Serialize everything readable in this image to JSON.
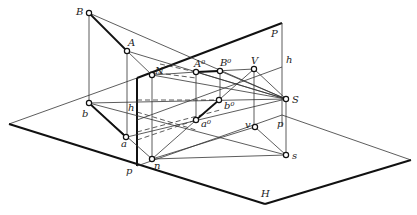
{
  "figure": {
    "type": "descriptive geometry - perspective projection of line AB onto picture plane P with ground plane H",
    "planes": {
      "picture_plane": "P",
      "ground_plane": "H"
    },
    "labels": {
      "B": "B",
      "A": "A",
      "N": "N",
      "A0": "A⁰",
      "B0": "B⁰",
      "V": "V",
      "S": "S",
      "h_top": "h",
      "P_top": "P",
      "b": "b",
      "h_left": "h",
      "a": "a",
      "n": "n",
      "a0": "a⁰",
      "b0": "b⁰",
      "v": "v",
      "p_right": "p",
      "s": "s",
      "p_bottom": "p",
      "H": "H"
    },
    "colors": {
      "line": "#333333",
      "heavy": "#111111",
      "background": "#ffffff"
    }
  }
}
